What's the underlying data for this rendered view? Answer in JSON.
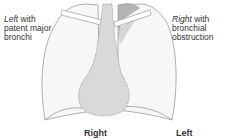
{
  "labels": {
    "left_top_italic": "Left",
    "left_top_rest": " with",
    "left_line2": "patent major",
    "left_line3": "bronchi",
    "right_top_italic": "Right",
    "right_top_rest": " with",
    "right_line2": "bronchial",
    "right_line3": "obstruction",
    "bottom_right": "Right",
    "bottom_left": "Left"
  },
  "colors": {
    "outline": "#9a9a9a",
    "mediastinum_fill": "#d9d9d9",
    "collapsed_lobe": "#a8a8a8",
    "lung_fill": "#f6f6f6"
  }
}
